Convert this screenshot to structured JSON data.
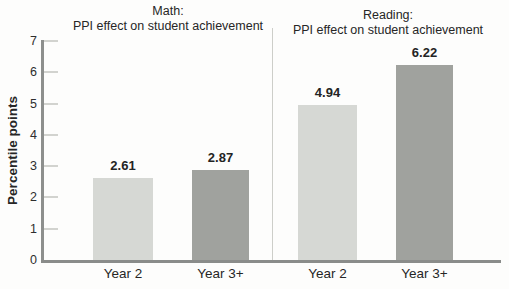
{
  "chart_data": {
    "type": "bar",
    "ylabel": "Percentile points",
    "ylim": [
      0,
      7
    ],
    "yticks": [
      0,
      1,
      2,
      3,
      4,
      5,
      6,
      7
    ],
    "grid": false,
    "legend": "none",
    "panels": [
      {
        "id": "math",
        "title_line1": "Math:",
        "title_line2": "PPI effect on student achievement",
        "categories": [
          "Year 2",
          "Year 3+"
        ],
        "values": [
          2.61,
          2.87
        ],
        "value_labels": [
          "2.61",
          "2.87"
        ]
      },
      {
        "id": "reading",
        "title_line1": "Reading:",
        "title_line2": "PPI effect on student achievement",
        "categories": [
          "Year 2",
          "Year 3+"
        ],
        "values": [
          4.94,
          6.22
        ],
        "value_labels": [
          "4.94",
          "6.22"
        ]
      }
    ],
    "colors": {
      "year2_bar": "#d6d8d4",
      "year3_bar": "#a0a29e",
      "axis": "#8d8f8d",
      "tick_mark": "#d2d3cf",
      "divider": "#cdcec9",
      "text": "#262626"
    }
  }
}
